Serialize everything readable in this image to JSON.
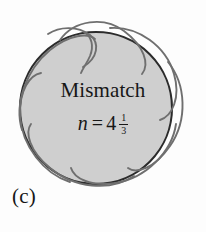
{
  "figure": {
    "caption_label": "(c)",
    "title": "Mismatch",
    "equation": {
      "variable": "n",
      "operator": "=",
      "whole": "4",
      "numerator": "1",
      "denominator": "3",
      "full_text": "n = 4 1/3"
    },
    "colors": {
      "background": "#fdfdfd",
      "disc_fill": "#cfcfcf",
      "disc_stroke": "#2b2b2b",
      "curve_stroke": "#6f6f6f",
      "text": "#171717"
    },
    "geometry": {
      "disc_center_x": 96,
      "disc_center_y": 108,
      "disc_radius": 76,
      "lobe_count": 5,
      "curve_is_open": true
    }
  }
}
